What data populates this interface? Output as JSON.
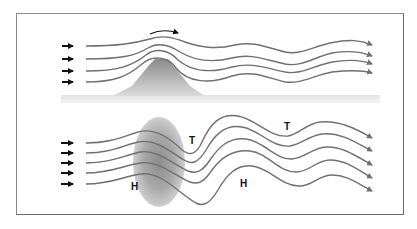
{
  "diagram": {
    "top_panel": {
      "description": "Airflow deflected over a mountain forming lee waves",
      "inflow_arrow_count": 4,
      "streamline_count": 4,
      "rotation_arrow": "curved-arrow-right"
    },
    "bottom_panel": {
      "description": "Airflow around a high-pressure area producing alternating troughs and ridges",
      "inflow_arrow_count": 5,
      "streamline_count": 5,
      "labels": {
        "high_1": "H",
        "low_1": "T",
        "high_2": "H",
        "low_2": "T"
      }
    },
    "colors": {
      "streamline": "#707070",
      "inflow_arrow": "#111111",
      "mountain_top": "#8a8a8a",
      "mountain_base": "#d8d8d8",
      "ground": "#e0e0e0",
      "high_ellipse": "#9a9a9a",
      "frame": "#8a8a8a"
    }
  }
}
